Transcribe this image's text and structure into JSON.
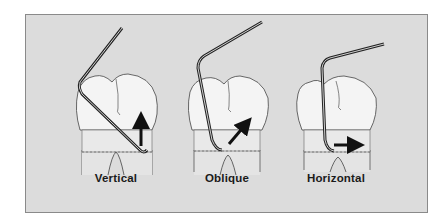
{
  "figure": {
    "panels": [
      {
        "id": "vertical",
        "label": "Vertical",
        "stroke_direction": "up",
        "icon": "arrow-up-icon"
      },
      {
        "id": "oblique",
        "label": "Oblique",
        "stroke_direction": "up-right",
        "icon": "arrow-up-right-icon"
      },
      {
        "id": "horizontal",
        "label": "Horizontal",
        "stroke_direction": "right",
        "icon": "arrow-right-icon"
      }
    ]
  },
  "colors": {
    "background": "#dcdcdc",
    "frame_border": "#8a8a8a",
    "tooth_fill": "#f4f4f4",
    "root_fill": "#e2e2e2",
    "outline": "#333333",
    "instrument": "#2a2a2a",
    "arrow": "#111111",
    "label": "#1a1a1a"
  }
}
